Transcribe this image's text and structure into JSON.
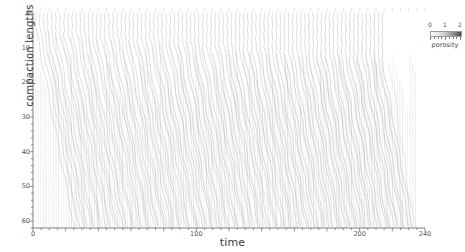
{
  "chart_data": {
    "type": "line",
    "title": "",
    "xlabel": "time",
    "ylabel": "compaction lengths",
    "xlim": [
      0,
      240
    ],
    "ylim": [
      0,
      62
    ],
    "y_inverted": true,
    "grid": false,
    "legend_position": "top-right",
    "xticks": [
      0,
      100,
      200,
      240
    ],
    "xtick_labels": [
      "0",
      "100",
      "200",
      "240"
    ],
    "xticks_minor_step": 5,
    "yticks": [
      0,
      10,
      20,
      30,
      40,
      50,
      60
    ],
    "ytick_labels": [
      "0",
      "10",
      "20",
      "30",
      "40",
      "50",
      "60"
    ],
    "yticks_minor_step": 2,
    "colorbar": {
      "label": "porosity",
      "ticks": [
        0,
        1,
        2
      ],
      "tick_labels": [
        "0",
        "1",
        "2"
      ],
      "vmin": 0,
      "vmax": 2,
      "colormap": "grayscale-light-to-dark",
      "low_color": "#ffffff",
      "high_color": "#4a4a4a"
    },
    "series_count": 86,
    "series": [
      {
        "name": "wave-track-1",
        "x0": 1.5,
        "depth_turn": 4.0,
        "slope": 0.255,
        "shade": 0.3
      },
      {
        "name": "wave-track-2",
        "x0": 4.0,
        "depth_turn": 4.4,
        "slope": 0.25,
        "shade": 0.32
      },
      {
        "name": "wave-track-3",
        "x0": 6.5,
        "depth_turn": 4.8,
        "slope": 0.246,
        "shade": 0.3
      },
      {
        "name": "wave-track-4",
        "x0": 9.0,
        "depth_turn": 5.2,
        "slope": 0.252,
        "shade": 0.34
      },
      {
        "name": "wave-track-5",
        "x0": 11.5,
        "depth_turn": 5.0,
        "slope": 0.248,
        "shade": 0.31
      },
      {
        "name": "wave-track-6",
        "x0": 14.0,
        "depth_turn": 5.6,
        "slope": 0.256,
        "shade": 0.33
      },
      {
        "name": "wave-track-7",
        "x0": 16.5,
        "depth_turn": 5.3,
        "slope": 0.244,
        "shade": 0.3
      },
      {
        "name": "wave-track-8",
        "x0": 19.0,
        "depth_turn": 6.0,
        "slope": 0.258,
        "shade": 0.35
      },
      {
        "name": "wave-track-9",
        "x0": 21.5,
        "depth_turn": 5.5,
        "slope": 0.25,
        "shade": 0.31
      },
      {
        "name": "wave-track-10",
        "x0": 24.0,
        "depth_turn": 6.2,
        "slope": 0.253,
        "shade": 0.34
      },
      {
        "name": "wave-track-11",
        "x0": 26.5,
        "depth_turn": 5.8,
        "slope": 0.247,
        "shade": 0.3
      },
      {
        "name": "wave-track-12",
        "x0": 29.0,
        "depth_turn": 6.4,
        "slope": 0.259,
        "shade": 0.36
      },
      {
        "name": "wave-track-13",
        "x0": 31.5,
        "depth_turn": 6.0,
        "slope": 0.251,
        "shade": 0.32
      },
      {
        "name": "wave-track-14",
        "x0": 34.0,
        "depth_turn": 6.6,
        "slope": 0.255,
        "shade": 0.35
      },
      {
        "name": "wave-track-15",
        "x0": 36.5,
        "depth_turn": 6.1,
        "slope": 0.245,
        "shade": 0.31
      },
      {
        "name": "wave-track-16",
        "x0": 39.0,
        "depth_turn": 6.8,
        "slope": 0.26,
        "shade": 0.37
      },
      {
        "name": "wave-track-17",
        "x0": 41.5,
        "depth_turn": 6.3,
        "slope": 0.249,
        "shade": 0.32
      },
      {
        "name": "wave-track-18",
        "x0": 44.0,
        "depth_turn": 7.0,
        "slope": 0.257,
        "shade": 0.36
      },
      {
        "name": "wave-track-19",
        "x0": 46.5,
        "depth_turn": 6.5,
        "slope": 0.246,
        "shade": 0.31
      },
      {
        "name": "wave-track-20",
        "x0": 49.0,
        "depth_turn": 7.2,
        "slope": 0.262,
        "shade": 0.38
      },
      {
        "name": "wave-track-21",
        "x0": 51.5,
        "depth_turn": 6.7,
        "slope": 0.252,
        "shade": 0.33
      },
      {
        "name": "wave-track-22",
        "x0": 54.0,
        "depth_turn": 7.4,
        "slope": 0.258,
        "shade": 0.37
      },
      {
        "name": "wave-track-23",
        "x0": 56.5,
        "depth_turn": 6.9,
        "slope": 0.248,
        "shade": 0.32
      },
      {
        "name": "wave-track-24",
        "x0": 59.0,
        "depth_turn": 7.6,
        "slope": 0.263,
        "shade": 0.39
      },
      {
        "name": "wave-track-25",
        "x0": 61.5,
        "depth_turn": 7.1,
        "slope": 0.253,
        "shade": 0.34
      },
      {
        "name": "wave-track-26",
        "x0": 64.0,
        "depth_turn": 7.8,
        "slope": 0.259,
        "shade": 0.38
      },
      {
        "name": "wave-track-27",
        "x0": 66.5,
        "depth_turn": 7.3,
        "slope": 0.249,
        "shade": 0.33
      },
      {
        "name": "wave-track-28",
        "x0": 69.0,
        "depth_turn": 8.0,
        "slope": 0.264,
        "shade": 0.4
      },
      {
        "name": "wave-track-29",
        "x0": 71.5,
        "depth_turn": 7.5,
        "slope": 0.254,
        "shade": 0.35
      },
      {
        "name": "wave-track-30",
        "x0": 74.0,
        "depth_turn": 8.2,
        "slope": 0.26,
        "shade": 0.39
      },
      {
        "name": "wave-track-31",
        "x0": 76.5,
        "depth_turn": 7.7,
        "slope": 0.25,
        "shade": 0.34
      },
      {
        "name": "wave-track-32",
        "x0": 79.0,
        "depth_turn": 8.4,
        "slope": 0.265,
        "shade": 0.41
      },
      {
        "name": "wave-track-33",
        "x0": 81.5,
        "depth_turn": 7.9,
        "slope": 0.255,
        "shade": 0.36
      },
      {
        "name": "wave-track-34",
        "x0": 84.0,
        "depth_turn": 8.6,
        "slope": 0.261,
        "shade": 0.4
      },
      {
        "name": "wave-track-35",
        "x0": 86.5,
        "depth_turn": 8.1,
        "slope": 0.251,
        "shade": 0.35
      },
      {
        "name": "wave-track-36",
        "x0": 89.0,
        "depth_turn": 8.8,
        "slope": 0.266,
        "shade": 0.42
      },
      {
        "name": "wave-track-37",
        "x0": 91.5,
        "depth_turn": 8.3,
        "slope": 0.256,
        "shade": 0.37
      },
      {
        "name": "wave-track-38",
        "x0": 94.0,
        "depth_turn": 9.0,
        "slope": 0.262,
        "shade": 0.41
      },
      {
        "name": "wave-track-39",
        "x0": 96.5,
        "depth_turn": 8.5,
        "slope": 0.252,
        "shade": 0.36
      },
      {
        "name": "wave-track-40",
        "x0": 99.0,
        "depth_turn": 9.2,
        "slope": 0.267,
        "shade": 0.43
      },
      {
        "name": "wave-track-41",
        "x0": 101.5,
        "depth_turn": 8.7,
        "slope": 0.257,
        "shade": 0.38
      },
      {
        "name": "wave-track-42",
        "x0": 104.0,
        "depth_turn": 9.4,
        "slope": 0.263,
        "shade": 0.42
      },
      {
        "name": "wave-track-43",
        "x0": 106.5,
        "depth_turn": 8.9,
        "slope": 0.253,
        "shade": 0.37
      },
      {
        "name": "wave-track-44",
        "x0": 109.0,
        "depth_turn": 9.6,
        "slope": 0.268,
        "shade": 0.44
      },
      {
        "name": "wave-track-45",
        "x0": 111.5,
        "depth_turn": 9.1,
        "slope": 0.258,
        "shade": 0.39
      },
      {
        "name": "wave-track-46",
        "x0": 114.0,
        "depth_turn": 9.8,
        "slope": 0.264,
        "shade": 0.43
      },
      {
        "name": "wave-track-47",
        "x0": 116.5,
        "depth_turn": 9.3,
        "slope": 0.254,
        "shade": 0.38
      },
      {
        "name": "wave-track-48",
        "x0": 119.0,
        "depth_turn": 10.0,
        "slope": 0.269,
        "shade": 0.45
      },
      {
        "name": "wave-track-49",
        "x0": 121.5,
        "depth_turn": 9.5,
        "slope": 0.259,
        "shade": 0.4
      },
      {
        "name": "wave-track-50",
        "x0": 124.0,
        "depth_turn": 10.2,
        "slope": 0.265,
        "shade": 0.44
      },
      {
        "name": "wave-track-51",
        "x0": 126.5,
        "depth_turn": 9.7,
        "slope": 0.255,
        "shade": 0.39
      },
      {
        "name": "wave-track-52",
        "x0": 129.0,
        "depth_turn": 10.4,
        "slope": 0.27,
        "shade": 0.46
      },
      {
        "name": "wave-track-53",
        "x0": 131.5,
        "depth_turn": 9.9,
        "slope": 0.26,
        "shade": 0.41
      },
      {
        "name": "wave-track-54",
        "x0": 134.0,
        "depth_turn": 10.6,
        "slope": 0.266,
        "shade": 0.45
      },
      {
        "name": "wave-track-55",
        "x0": 136.5,
        "depth_turn": 10.1,
        "slope": 0.256,
        "shade": 0.4
      },
      {
        "name": "wave-track-56",
        "x0": 139.0,
        "depth_turn": 10.8,
        "slope": 0.271,
        "shade": 0.47
      },
      {
        "name": "wave-track-57",
        "x0": 141.5,
        "depth_turn": 10.3,
        "slope": 0.261,
        "shade": 0.42
      },
      {
        "name": "wave-track-58",
        "x0": 144.0,
        "depth_turn": 11.0,
        "slope": 0.267,
        "shade": 0.46
      },
      {
        "name": "wave-track-59",
        "x0": 146.5,
        "depth_turn": 10.5,
        "slope": 0.257,
        "shade": 0.41
      },
      {
        "name": "wave-track-60",
        "x0": 149.0,
        "depth_turn": 11.2,
        "slope": 0.272,
        "shade": 0.48
      },
      {
        "name": "wave-track-61",
        "x0": 151.5,
        "depth_turn": 10.7,
        "slope": 0.262,
        "shade": 0.43
      },
      {
        "name": "wave-track-62",
        "x0": 154.0,
        "depth_turn": 11.4,
        "slope": 0.268,
        "shade": 0.47
      },
      {
        "name": "wave-track-63",
        "x0": 156.5,
        "depth_turn": 10.9,
        "slope": 0.258,
        "shade": 0.42
      },
      {
        "name": "wave-track-64",
        "x0": 159.0,
        "depth_turn": 11.6,
        "slope": 0.273,
        "shade": 0.49
      },
      {
        "name": "wave-track-65",
        "x0": 161.5,
        "depth_turn": 11.1,
        "slope": 0.263,
        "shade": 0.44
      },
      {
        "name": "wave-track-66",
        "x0": 164.0,
        "depth_turn": 11.8,
        "slope": 0.269,
        "shade": 0.48
      },
      {
        "name": "wave-track-67",
        "x0": 166.5,
        "depth_turn": 11.3,
        "slope": 0.259,
        "shade": 0.43
      },
      {
        "name": "wave-track-68",
        "x0": 169.0,
        "depth_turn": 12.0,
        "slope": 0.274,
        "shade": 0.5
      },
      {
        "name": "wave-track-69",
        "x0": 171.5,
        "depth_turn": 11.5,
        "slope": 0.264,
        "shade": 0.45
      },
      {
        "name": "wave-track-70",
        "x0": 174.0,
        "depth_turn": 12.2,
        "slope": 0.27,
        "shade": 0.49
      },
      {
        "name": "wave-track-71",
        "x0": 176.5,
        "depth_turn": 11.7,
        "slope": 0.26,
        "shade": 0.44
      },
      {
        "name": "wave-track-72",
        "x0": 179.0,
        "depth_turn": 12.4,
        "slope": 0.275,
        "shade": 0.51
      },
      {
        "name": "wave-track-73",
        "x0": 181.5,
        "depth_turn": 11.9,
        "slope": 0.265,
        "shade": 0.46
      },
      {
        "name": "wave-track-74",
        "x0": 184.0,
        "depth_turn": 12.6,
        "slope": 0.271,
        "shade": 0.5
      },
      {
        "name": "wave-track-75",
        "x0": 186.5,
        "depth_turn": 12.1,
        "slope": 0.261,
        "shade": 0.45
      },
      {
        "name": "wave-track-76",
        "x0": 189.0,
        "depth_turn": 12.8,
        "slope": 0.276,
        "shade": 0.52
      },
      {
        "name": "wave-track-77",
        "x0": 191.5,
        "depth_turn": 12.3,
        "slope": 0.266,
        "shade": 0.47
      },
      {
        "name": "wave-track-78",
        "x0": 194.0,
        "depth_turn": 13.0,
        "slope": 0.272,
        "shade": 0.51
      },
      {
        "name": "wave-track-79",
        "x0": 196.5,
        "depth_turn": 12.5,
        "slope": 0.262,
        "shade": 0.46
      },
      {
        "name": "wave-track-80",
        "x0": 199.0,
        "depth_turn": 13.2,
        "slope": 0.277,
        "shade": 0.53
      },
      {
        "name": "wave-track-81",
        "x0": 201.5,
        "depth_turn": 12.7,
        "slope": 0.267,
        "shade": 0.48
      },
      {
        "name": "wave-track-82",
        "x0": 204.0,
        "depth_turn": 13.4,
        "slope": 0.273,
        "shade": 0.52
      },
      {
        "name": "wave-track-83",
        "x0": 206.5,
        "depth_turn": 12.9,
        "slope": 0.263,
        "shade": 0.47
      },
      {
        "name": "wave-track-84",
        "x0": 209.0,
        "depth_turn": 13.6,
        "slope": 0.278,
        "shade": 0.54
      },
      {
        "name": "wave-track-85",
        "x0": 211.5,
        "depth_turn": 13.1,
        "slope": 0.268,
        "shade": 0.49
      },
      {
        "name": "wave-track-86",
        "x0": 214.0,
        "depth_turn": 13.8,
        "slope": 0.274,
        "shade": 0.53
      }
    ]
  }
}
